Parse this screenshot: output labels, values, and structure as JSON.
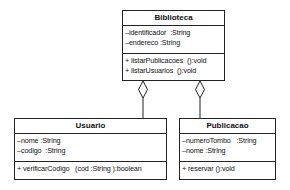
{
  "diagram": {
    "type": "UML class diagram",
    "classes": [
      {
        "id": "biblioteca",
        "name": "Biblioteca",
        "attributes": [
          "–identificador  :String",
          "–endereco :String"
        ],
        "operations": [
          "+ listarPublicacoes  ():void",
          "+ listarUsuarios  ():void"
        ]
      },
      {
        "id": "usuario",
        "name": "Usuario",
        "attributes": [
          "–nome :String",
          "–codigo  :String"
        ],
        "operations": [
          "+ verificarCodigo   (cod :String ):boolean"
        ]
      },
      {
        "id": "publicacao",
        "name": "Publicacao",
        "attributes": [
          "–numeroTombo   :String",
          "–nome :String"
        ],
        "operations": [
          "+ reservar ():void"
        ]
      }
    ],
    "relationships": [
      {
        "type": "aggregation",
        "whole": "Biblioteca",
        "part": "Usuario"
      },
      {
        "type": "aggregation",
        "whole": "Biblioteca",
        "part": "Publicacao"
      }
    ],
    "colors": {
      "line": "#222222",
      "background": "#ffffff"
    }
  }
}
